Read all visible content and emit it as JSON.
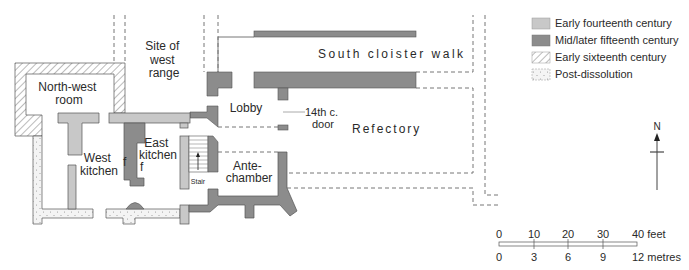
{
  "plan": {
    "labels": {
      "site_west_range": [
        "Site of",
        "west",
        "range"
      ],
      "north_west_room": [
        "North-west",
        "room"
      ],
      "west_kitchen": [
        "West",
        "kitchen"
      ],
      "east_kitchen": [
        "East",
        "kitchen"
      ],
      "fireplace_mark": "f",
      "stair": "Stair",
      "lobby": "Lobby",
      "door_14th": [
        "14th c.",
        "door"
      ],
      "refectory": "Refectory",
      "ante_chamber": [
        "Ante-",
        "chamber"
      ],
      "south_cloister_walk": "South cloister walk"
    }
  },
  "legend": {
    "items": [
      {
        "label": "Early fourteenth century",
        "color": "#c8c8c8",
        "pattern": "solid"
      },
      {
        "label": "Mid/later fifteenth century",
        "color": "#8c8c8c",
        "pattern": "solid"
      },
      {
        "label": "Early sixteenth century",
        "color": "#ffffff",
        "pattern": "hatched"
      },
      {
        "label": "Post-dissolution",
        "color": "#f4f4f4",
        "pattern": "dotted"
      }
    ]
  },
  "north_arrow": {
    "label": "N"
  },
  "scale_bar": {
    "feet": {
      "ticks": [
        "0",
        "10",
        "20",
        "30",
        "40 feet"
      ]
    },
    "metres": {
      "ticks": [
        "0",
        "3",
        "6",
        "9",
        "12 metres"
      ]
    }
  }
}
